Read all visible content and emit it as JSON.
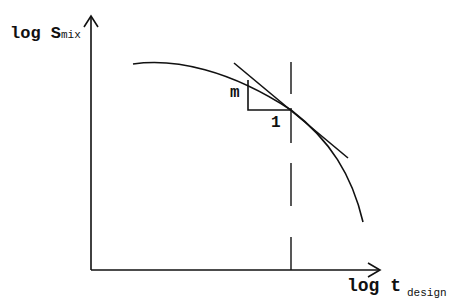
{
  "diagram": {
    "y_axis_label": {
      "main": "log S",
      "sub": "mix"
    },
    "x_axis_label": {
      "main": "log t",
      "sub": "design"
    },
    "slope_labels": {
      "rise": "m",
      "run": "1"
    },
    "elements": [
      "y-axis arrow",
      "x-axis arrow",
      "decreasing curve",
      "tangent line",
      "slope triangle",
      "dashed vertical line at design time"
    ],
    "colors": {
      "stroke": "#111111",
      "background": "#ffffff"
    }
  }
}
